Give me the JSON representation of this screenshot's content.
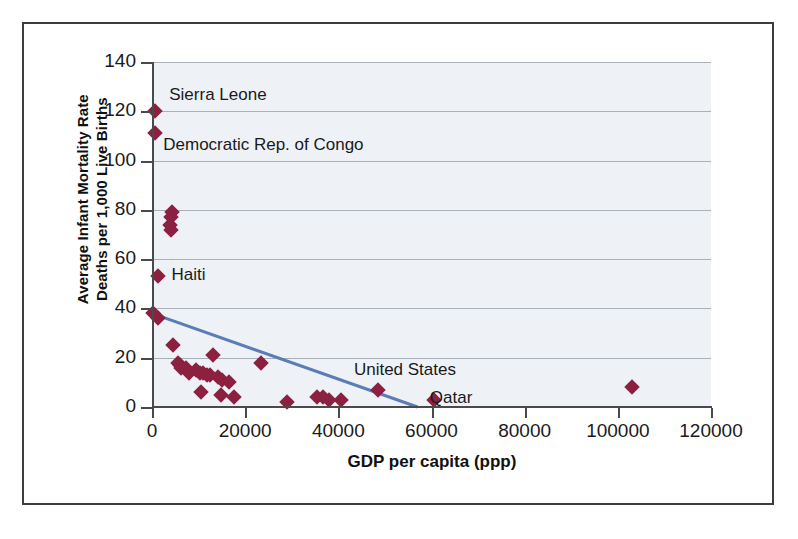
{
  "chart_data": {
    "type": "scatter",
    "title": "",
    "xlabel": "GDP per capita (ppp)",
    "ylabel": "Average Infant Mortality Rate\nDeaths per 1,000 Live Births",
    "ylabel_line1": "Average Infant Mortality Rate",
    "ylabel_line2": "Deaths per 1,000 Live Births",
    "xlim": [
      0,
      120000
    ],
    "ylim": [
      0,
      140
    ],
    "xticks": [
      0,
      20000,
      40000,
      60000,
      80000,
      100000,
      120000
    ],
    "xtick_labels": [
      "0",
      "20000",
      "40000",
      "60000",
      "80000",
      "100000",
      "120000"
    ],
    "yticks": [
      0,
      20,
      40,
      60,
      80,
      100,
      120,
      140
    ],
    "ytick_labels": [
      "0",
      "20",
      "40",
      "60",
      "80",
      "100",
      "120",
      "140"
    ],
    "grid": "horizontal",
    "legend": "none",
    "marker_shape": "diamond",
    "marker_color": "#8c2040",
    "plot_background": "#eef2f7",
    "trendline": {
      "type": "linear",
      "color": "#5b7cb5",
      "x_start": 0,
      "y_start": 38,
      "x_end": 57000,
      "y_end": 0
    },
    "points": [
      {
        "x": 700,
        "y": 120
      },
      {
        "x": 700,
        "y": 111
      },
      {
        "x": 4200,
        "y": 79
      },
      {
        "x": 4000,
        "y": 77
      },
      {
        "x": 3900,
        "y": 74
      },
      {
        "x": 4100,
        "y": 72
      },
      {
        "x": 1200,
        "y": 53
      },
      {
        "x": 300,
        "y": 38
      },
      {
        "x": 1300,
        "y": 36
      },
      {
        "x": 4600,
        "y": 25
      },
      {
        "x": 5600,
        "y": 18
      },
      {
        "x": 6000,
        "y": 17
      },
      {
        "x": 6300,
        "y": 16
      },
      {
        "x": 7200,
        "y": 16
      },
      {
        "x": 7600,
        "y": 15
      },
      {
        "x": 8000,
        "y": 14
      },
      {
        "x": 9500,
        "y": 15
      },
      {
        "x": 10200,
        "y": 14
      },
      {
        "x": 11000,
        "y": 14
      },
      {
        "x": 11800,
        "y": 13
      },
      {
        "x": 12500,
        "y": 13
      },
      {
        "x": 10500,
        "y": 6
      },
      {
        "x": 13000,
        "y": 21
      },
      {
        "x": 14200,
        "y": 12
      },
      {
        "x": 15000,
        "y": 11
      },
      {
        "x": 14800,
        "y": 5
      },
      {
        "x": 16500,
        "y": 10
      },
      {
        "x": 17500,
        "y": 4
      },
      {
        "x": 23300,
        "y": 18
      },
      {
        "x": 29000,
        "y": 2
      },
      {
        "x": 35500,
        "y": 4
      },
      {
        "x": 36800,
        "y": 4
      },
      {
        "x": 38000,
        "y": 3
      },
      {
        "x": 40500,
        "y": 3
      },
      {
        "x": 48500,
        "y": 7
      },
      {
        "x": 60500,
        "y": 3
      },
      {
        "x": 103000,
        "y": 8
      }
    ],
    "annotations": [
      {
        "label": "Sierra Leone",
        "point_x": 700,
        "point_y": 120
      },
      {
        "label": "Democratic Rep. of Congo",
        "point_x": 700,
        "point_y": 111
      },
      {
        "label": "Haiti",
        "point_x": 1200,
        "point_y": 53
      },
      {
        "label": "United States",
        "point_x": 48500,
        "point_y": 7
      },
      {
        "label": "Qatar",
        "point_x": 60500,
        "point_y": 3
      }
    ]
  }
}
